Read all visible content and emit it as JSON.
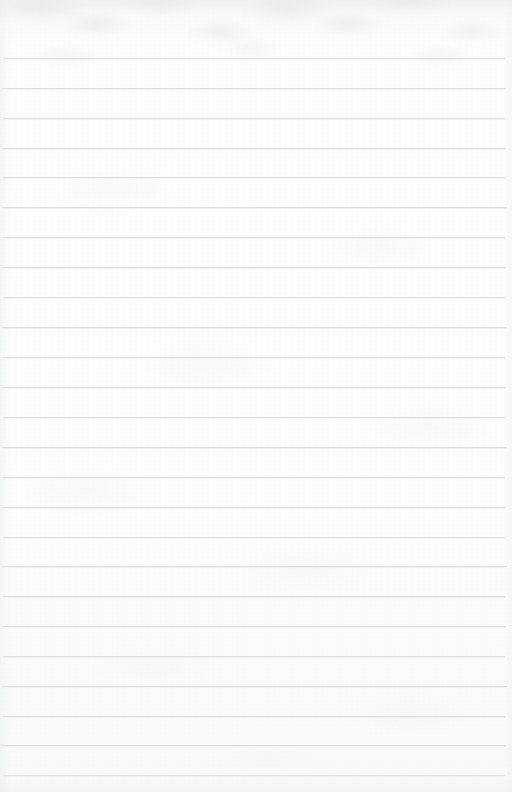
{
  "document": {
    "kind": "lined-paper",
    "title": "",
    "body_text": "",
    "page_width": 512,
    "page_height": 792
  },
  "paper": {
    "background_color": "#fdfdfd",
    "rule_color": "#d7d9db",
    "texture_color": "#ced1d4",
    "rule_spacing": 30,
    "first_rule_y": 58,
    "rule_left": 2,
    "rule_right": 507,
    "rule_count": 25
  },
  "rules": [
    {
      "y": 58,
      "left": 3,
      "right": 505,
      "opacity": 0.85
    },
    {
      "y": 88,
      "left": 2,
      "right": 506,
      "opacity": 0.9
    },
    {
      "y": 118,
      "left": 3,
      "right": 505,
      "opacity": 0.85
    },
    {
      "y": 148,
      "left": 2,
      "right": 506,
      "opacity": 0.92
    },
    {
      "y": 177,
      "left": 3,
      "right": 505,
      "opacity": 0.86
    },
    {
      "y": 207,
      "left": 2,
      "right": 507,
      "opacity": 0.9
    },
    {
      "y": 237,
      "left": 3,
      "right": 505,
      "opacity": 0.84
    },
    {
      "y": 267,
      "left": 2,
      "right": 506,
      "opacity": 0.9
    },
    {
      "y": 297,
      "left": 3,
      "right": 505,
      "opacity": 0.82
    },
    {
      "y": 327,
      "left": 2,
      "right": 507,
      "opacity": 0.88
    },
    {
      "y": 357,
      "left": 3,
      "right": 505,
      "opacity": 0.86
    },
    {
      "y": 387,
      "left": 2,
      "right": 506,
      "opacity": 0.9
    },
    {
      "y": 417,
      "left": 3,
      "right": 505,
      "opacity": 0.84
    },
    {
      "y": 447,
      "left": 2,
      "right": 507,
      "opacity": 0.88
    },
    {
      "y": 477,
      "left": 3,
      "right": 505,
      "opacity": 0.86
    },
    {
      "y": 507,
      "left": 2,
      "right": 506,
      "opacity": 0.9
    },
    {
      "y": 537,
      "left": 3,
      "right": 505,
      "opacity": 0.8
    },
    {
      "y": 566,
      "left": 2,
      "right": 507,
      "opacity": 0.88
    },
    {
      "y": 596,
      "left": 3,
      "right": 505,
      "opacity": 0.86
    },
    {
      "y": 626,
      "left": 2,
      "right": 506,
      "opacity": 0.9
    },
    {
      "y": 656,
      "left": 3,
      "right": 505,
      "opacity": 0.84
    },
    {
      "y": 686,
      "left": 2,
      "right": 507,
      "opacity": 0.88
    },
    {
      "y": 716,
      "left": 3,
      "right": 505,
      "opacity": 0.86
    },
    {
      "y": 745,
      "left": 1,
      "right": 506,
      "opacity": 0.92
    },
    {
      "y": 775,
      "left": 3,
      "right": 505,
      "opacity": 0.7
    }
  ]
}
